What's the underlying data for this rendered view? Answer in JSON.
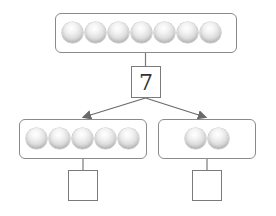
{
  "diagram": {
    "type": "part-whole number bond",
    "whole": {
      "count": 7,
      "label": "7"
    },
    "parts": [
      {
        "count": 5,
        "label": ""
      },
      {
        "count": 2,
        "label": ""
      }
    ],
    "colors": {
      "stroke": "#7a7a7a",
      "ball": "#d9d9d9",
      "text": "#333333"
    }
  }
}
